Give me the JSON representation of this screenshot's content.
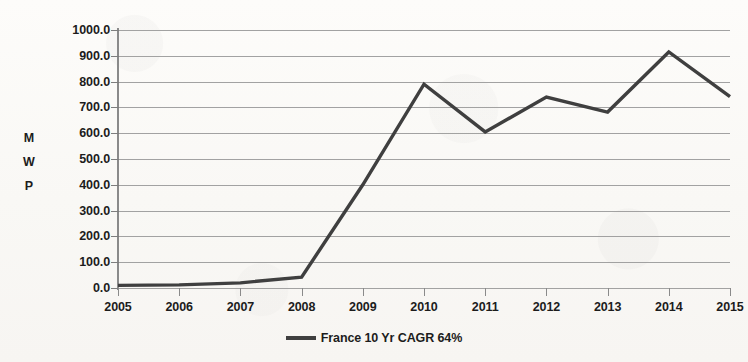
{
  "chart_data": {
    "type": "line",
    "title": "",
    "xlabel": "",
    "ylabel": "MWP",
    "ylabel_chars": [
      "M",
      "W",
      "P"
    ],
    "categories": [
      "2005",
      "2006",
      "2007",
      "2008",
      "2009",
      "2010",
      "2011",
      "2012",
      "2013",
      "2014",
      "2015"
    ],
    "series": [
      {
        "name": "France 10 Yr CAGR 64%",
        "values": [
          10,
          12,
          20,
          42,
          400,
          790,
          605,
          740,
          682,
          915,
          742
        ],
        "color": "#3f3f3f"
      }
    ],
    "ylim": [
      0,
      1000
    ],
    "ytick_step": 100,
    "ytick_labels": [
      "0.0",
      "100.0",
      "200.0",
      "300.0",
      "400.0",
      "500.0",
      "600.0",
      "700.0",
      "800.0",
      "900.0",
      "1000.0"
    ],
    "ytick_values": [
      0,
      100,
      200,
      300,
      400,
      500,
      600,
      700,
      800,
      900,
      1000
    ],
    "grid": true,
    "grid_color": "#9a9a9a",
    "legend_position": "bottom",
    "legend": [
      {
        "label": "France 10 Yr CAGR 64%",
        "color": "#3f3f3f"
      }
    ],
    "background_color": "#fbfaf8"
  }
}
